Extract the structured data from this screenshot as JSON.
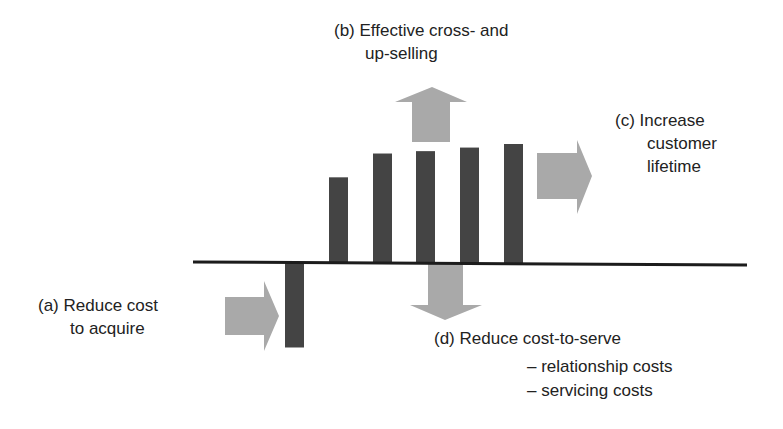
{
  "diagram": {
    "labels": {
      "a": {
        "line1": "(a) Reduce cost",
        "line2": "to acquire"
      },
      "b": {
        "line1": "(b) Effective cross- and",
        "line2": "up-selling"
      },
      "c": {
        "line1": "(c) Increase",
        "line2": "customer",
        "line3": "lifetime"
      },
      "d": {
        "line1": "(d) Reduce cost-to-serve",
        "line2": "– relationship costs",
        "line3": "– servicing costs"
      }
    },
    "arrows": [
      {
        "id": "a",
        "direction": "right",
        "meaning": "Reduce cost to acquire"
      },
      {
        "id": "b",
        "direction": "up",
        "meaning": "Effective cross- and up-selling"
      },
      {
        "id": "c",
        "direction": "right",
        "meaning": "Increase customer lifetime"
      },
      {
        "id": "d",
        "direction": "down",
        "meaning": "Reduce cost-to-serve"
      }
    ],
    "colors": {
      "bar": "#444444",
      "arrow": "#a9a9a9",
      "axis": "#1c1c1c",
      "text": "#222222"
    }
  },
  "chart_data": {
    "type": "bar",
    "title": "",
    "xlabel": "",
    "ylabel": "",
    "units": "relative (arbitrary, max positive = 100)",
    "categories": [
      "period 1",
      "period 2",
      "period 3",
      "period 4",
      "period 5",
      "period 6"
    ],
    "values": [
      -71,
      72,
      92,
      94,
      97,
      100
    ],
    "ylim": [
      -75,
      105
    ],
    "grid": false,
    "legend": "none"
  }
}
